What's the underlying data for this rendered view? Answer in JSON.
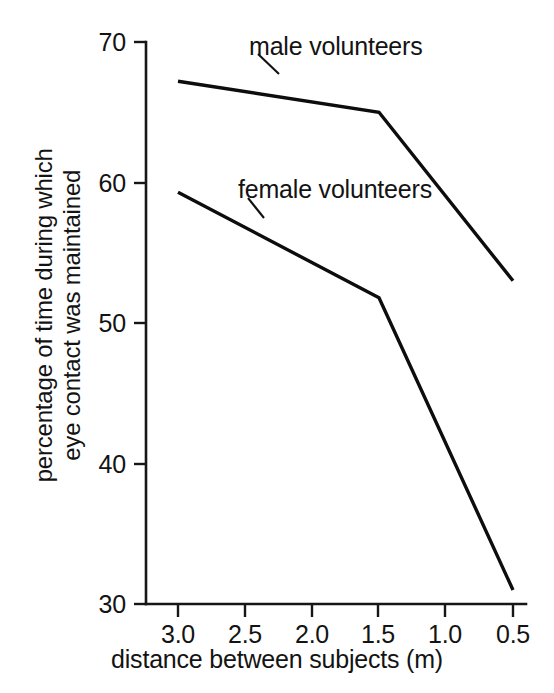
{
  "chart_data": {
    "type": "line",
    "title": "",
    "xlabel": "distance between subjects (m)",
    "ylabel": "percentage of time during which eye contact was maintained",
    "ylabel_line1": "percentage of time during which",
    "ylabel_line2": "eye contact was maintained",
    "x": [
      3.0,
      1.5,
      0.5
    ],
    "xlim": [
      3.25,
      0.25
    ],
    "ylim": [
      30,
      70
    ],
    "grid": false,
    "legend_position": "inline-annotations",
    "xticks": [
      "3.0",
      "2.5",
      "2.0",
      "1.5",
      "1.0",
      "0.5"
    ],
    "xtick_values": [
      3.0,
      2.5,
      2.0,
      1.5,
      1.0,
      0.5
    ],
    "yticks": [
      "30",
      "40",
      "50",
      "60",
      "70"
    ],
    "ytick_values": [
      30,
      40,
      50,
      60,
      70
    ],
    "series": [
      {
        "name": "male volunteers",
        "values": [
          67.2,
          65.0,
          53.0
        ]
      },
      {
        "name": "female volunteers",
        "values": [
          59.3,
          51.8,
          31.0
        ]
      }
    ],
    "annotations": [
      {
        "text": "male volunteers",
        "points_to_series": "male volunteers"
      },
      {
        "text": "female volunteers",
        "points_to_series": "female volunteers"
      }
    ]
  },
  "axes": {
    "x_title": "distance between subjects (m)",
    "y_title_line1": "percentage of time during which",
    "y_title_line2": "eye contact was maintained",
    "x_ticks": [
      {
        "label": "3.0"
      },
      {
        "label": "2.5"
      },
      {
        "label": "2.0"
      },
      {
        "label": "1.5"
      },
      {
        "label": "1.0"
      },
      {
        "label": "0.5"
      }
    ],
    "y_ticks": [
      {
        "label": "70"
      },
      {
        "label": "60"
      },
      {
        "label": "50"
      },
      {
        "label": "40"
      },
      {
        "label": "30"
      }
    ]
  },
  "labels": {
    "male": "male volunteers",
    "female": "female volunteers"
  },
  "colors": {
    "line": "#0d0d0d",
    "axis": "#161616",
    "text": "#131313",
    "background": "#ffffff"
  }
}
